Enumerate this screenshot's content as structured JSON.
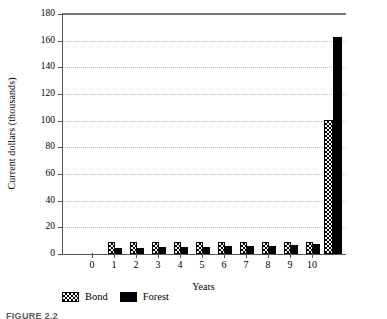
{
  "chart_data": {
    "type": "bar",
    "title": "",
    "xlabel": "Years",
    "ylabel": "Current dollars (thousands)",
    "ylim": [
      0,
      180
    ],
    "ytick_step": 20,
    "yticks": [
      0,
      20,
      40,
      60,
      80,
      100,
      120,
      140,
      160,
      180
    ],
    "xticks": [
      0,
      1,
      2,
      3,
      4,
      5,
      6,
      7,
      8,
      9,
      10
    ],
    "categories": [
      "1",
      "2",
      "3",
      "4",
      "5",
      "6",
      "7",
      "8",
      "9",
      "10",
      "total"
    ],
    "grid": true,
    "grid_axis": "y",
    "grid_style": "dotted",
    "legend_position": "below-left",
    "series": [
      {
        "name": "Bond",
        "pattern": "checkerboard-hatch",
        "color": "#ffffff",
        "pattern_color": "#000000",
        "values": [
          9.0,
          9.0,
          9.0,
          9.0,
          9.0,
          9.0,
          9.0,
          9.0,
          9.0,
          9.0,
          100.5
        ]
      },
      {
        "name": "Forest",
        "pattern": "solid",
        "color": "#000000",
        "pattern_color": "#000000",
        "values": [
          4.3,
          4.6,
          4.9,
          5.2,
          5.4,
          5.7,
          6.0,
          6.3,
          6.7,
          7.2,
          163.0
        ]
      }
    ]
  },
  "axes": {
    "y_title": "Current dollars (thousands)",
    "x_title": "Years",
    "y_tick_labels": [
      "0",
      "20",
      "40",
      "60",
      "80",
      "100",
      "120",
      "140",
      "160",
      "180"
    ],
    "x_tick_labels": [
      "0",
      "1",
      "2",
      "3",
      "4",
      "5",
      "6",
      "7",
      "8",
      "9",
      "10"
    ]
  },
  "legend": {
    "items": [
      {
        "label": "Bond",
        "swatch": "bond-hatch-swatch"
      },
      {
        "label": "Forest",
        "swatch": "forest-solid-swatch"
      }
    ]
  },
  "caption": {
    "text": "FIGURE 2.2"
  },
  "colors": {
    "axis": "#555555",
    "grid": "#b9b9b9",
    "forest": "#000000",
    "bond_fill": "#ffffff",
    "bond_pattern": "#000000"
  }
}
